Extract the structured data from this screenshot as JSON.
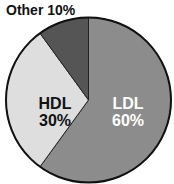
{
  "chart_data": {
    "type": "pie",
    "title": "",
    "categories": [
      "LDL",
      "HDL",
      "Other"
    ],
    "values": [
      60,
      30,
      10
    ],
    "unit": "%",
    "colors": [
      "#8c8c8c",
      "#dedede",
      "#555555"
    ],
    "label_colors": [
      "#ffffff",
      "#111111",
      "#111111"
    ],
    "start_angle_deg": 0,
    "direction": "clockwise",
    "legend": "none",
    "labels": [
      {
        "name": "LDL",
        "value_text": "60%",
        "position": "inside"
      },
      {
        "name": "HDL",
        "value_text": "30%",
        "position": "inside"
      },
      {
        "name": "Other",
        "value_text": "10%",
        "position": "outside-top-left"
      }
    ]
  },
  "labels": {
    "other": "Other 10%",
    "hdl_name": "HDL",
    "hdl_value": "30%",
    "ldl_name": "LDL",
    "ldl_value": "60%"
  },
  "style": {
    "outline_color": "#111111",
    "background": "#ffffff"
  }
}
